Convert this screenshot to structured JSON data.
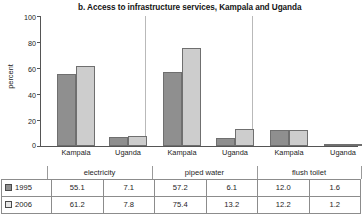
{
  "chart_data": {
    "type": "bar",
    "title": "b. Access to infrastructure services, Kampala and Uganda",
    "xlabel": "",
    "ylabel": "percent",
    "ylim": [
      0,
      100
    ],
    "yticks": [
      100,
      80,
      60,
      40,
      20,
      0
    ],
    "grid": false,
    "legend_position": "table-row-labels",
    "categories": [
      "Kampala electricity",
      "Uganda electricity",
      "Kampala piped water",
      "Uganda piped water",
      "Kampala flush toilet",
      "Uganda flush toilet"
    ],
    "groups": [
      {
        "name": "electricity",
        "subcategories": [
          "Kampala",
          "Uganda"
        ]
      },
      {
        "name": "piped water",
        "subcategories": [
          "Kampala",
          "Uganda"
        ]
      },
      {
        "name": "flush toilet",
        "subcategories": [
          "Kampala",
          "Uganda"
        ]
      }
    ],
    "series": [
      {
        "name": "1995",
        "color": "#8f8f8f",
        "values": [
          55.1,
          7.1,
          57.2,
          6.1,
          12.0,
          1.6
        ]
      },
      {
        "name": "2006",
        "color": "#cdcdcd",
        "values": [
          61.2,
          7.8,
          75.4,
          13.2,
          12.2,
          1.2
        ]
      }
    ]
  },
  "axis": {
    "ylabel": "percent",
    "ticks": [
      "100",
      "80",
      "60",
      "40",
      "20",
      "0"
    ]
  },
  "xlabels": [
    {
      "label": "Kampala"
    },
    {
      "label": "Uganda"
    },
    {
      "label": "Kampala"
    },
    {
      "label": "Uganda"
    },
    {
      "label": "Kampala"
    },
    {
      "label": "Uganda"
    }
  ],
  "table": {
    "group_headers": [
      "electricity",
      "piped water",
      "flush toilet"
    ],
    "rows": [
      {
        "year": "1995",
        "swatch": "#8f8f8f",
        "values": [
          "55.1",
          "7.1",
          "57.2",
          "6.1",
          "12.0",
          "1.6"
        ]
      },
      {
        "year": "2006",
        "swatch": "#e6e6e6",
        "values": [
          "61.2",
          "7.8",
          "75.4",
          "13.2",
          "12.2",
          "1.2"
        ]
      }
    ]
  }
}
